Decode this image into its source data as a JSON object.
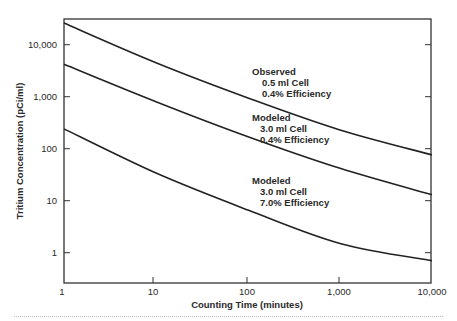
{
  "chart_data": {
    "type": "line",
    "title": "",
    "xlabel": "Counting Time (minutes)",
    "ylabel": "Tritium Concentration (pCi/ml)",
    "xscale": "log",
    "yscale": "log",
    "xlim": [
      1,
      10000
    ],
    "ylim": [
      0.5,
      32000
    ],
    "xticks": [
      1,
      10,
      100,
      1000,
      10000
    ],
    "xtick_labels": [
      "1",
      "10",
      "100",
      "1,000",
      "10,000"
    ],
    "yticks": [
      1,
      10,
      100,
      1000,
      10000
    ],
    "ytick_labels": [
      "1",
      "10",
      "100",
      "1,000",
      "10,000"
    ],
    "grid": false,
    "legend": "none (inline annotations)",
    "x": [
      1,
      10,
      100,
      1000,
      10000
    ],
    "series": [
      {
        "name": "Observed, 0.5 ml Cell, 0.4% Efficiency",
        "values": [
          26000,
          4500,
          950,
          230,
          76
        ],
        "annotation": [
          "Observed",
          "0.5 ml Cell",
          "0.4% Efficiency"
        ]
      },
      {
        "name": "Modeled, 3.0 ml Cell, 0.4% Efficiency",
        "values": [
          4200,
          800,
          170,
          42,
          13
        ],
        "annotation": [
          "Modeled",
          "3.0 ml Cell",
          "0.4% Efficiency"
        ]
      },
      {
        "name": "Modeled, 3.0 ml Cell, 7.0% Efficiency",
        "values": [
          240,
          34,
          6.6,
          1.5,
          0.7
        ],
        "annotation": [
          "Modeled",
          "3.0 ml Cell",
          "7.0% Efficiency"
        ]
      }
    ]
  },
  "labels": {
    "xlabel": "Counting Time (minutes)",
    "ylabel": "Tritium Concentration (pCi/ml)",
    "xticks": [
      "1",
      "10",
      "100",
      "1,000",
      "10,000"
    ],
    "yticks": [
      "1",
      "10",
      "100",
      "1,000",
      "10,000"
    ],
    "series": [
      {
        "l1": "Observed",
        "l2": "0.5 ml Cell",
        "l3": "0.4% Efficiency"
      },
      {
        "l1": "Modeled",
        "l2": "3.0 ml Cell",
        "l3": "0.4% Efficiency"
      },
      {
        "l1": "Modeled",
        "l2": "3.0 ml Cell",
        "l3": "7.0% Efficiency"
      }
    ]
  }
}
